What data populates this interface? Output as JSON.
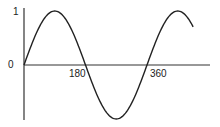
{
  "chart_data": {
    "type": "line",
    "title": "",
    "xlabel": "",
    "ylabel": "",
    "x_ticks": [
      "180",
      "360"
    ],
    "y_ticks": [
      "1",
      "0"
    ],
    "series": [
      {
        "name": "sin(x)",
        "function": "sin",
        "x": [
          0,
          45,
          90,
          135,
          180,
          225,
          270,
          315,
          360,
          405,
          450,
          495
        ],
        "values": [
          0,
          0.707,
          1,
          0.707,
          0,
          -0.707,
          -1,
          -0.707,
          0,
          0.707,
          1,
          0.707
        ]
      }
    ],
    "xlim": [
      0,
      540
    ],
    "ylim": [
      -1,
      1
    ],
    "grid": false,
    "legend": false
  },
  "labels": {
    "y_one": "1",
    "y_zero": "0",
    "x_180": "180",
    "x_360": "360"
  }
}
